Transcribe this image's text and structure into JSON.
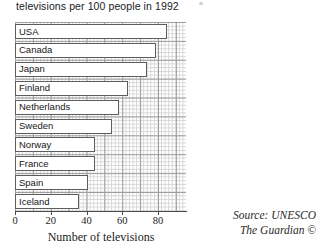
{
  "title": "televisions per 100 people in 1992",
  "axis": {
    "xlabel": "Number of televisions",
    "ticks": [
      "0",
      "20",
      "40",
      "60",
      "80"
    ]
  },
  "source": {
    "line1": "Source: UNESCO",
    "line2": "The Guardian ©"
  },
  "chart_data": {
    "type": "bar",
    "orientation": "horizontal",
    "title": "televisions per 100 people in 1992",
    "xlabel": "Number of televisions",
    "ylabel": "",
    "xlim": [
      0,
      96
    ],
    "grid": true,
    "legend": "none",
    "categories": [
      "USA",
      "Canada",
      "Japan",
      "Finland",
      "Netherlands",
      "Sweden",
      "Norway",
      "France",
      "Spain",
      "Iceland"
    ],
    "values": [
      85,
      79,
      74,
      63,
      58,
      54,
      45,
      45,
      41,
      36
    ],
    "series": [
      {
        "name": "Televisions per 100 people (1992)",
        "values": [
          85,
          79,
          74,
          63,
          58,
          54,
          45,
          45,
          41,
          36
        ]
      }
    ],
    "tick_values": [
      0,
      20,
      40,
      60,
      80
    ],
    "source": "UNESCO / The Guardian ©"
  },
  "style": {
    "bar_fill": "#ffffff",
    "bar_border": "#5d5d5d",
    "grid_major": "#9d9d9d",
    "grid_minor": "#d6d6d6",
    "axis_color": "#4a4a4a",
    "text_color": "#1b1b1b"
  }
}
